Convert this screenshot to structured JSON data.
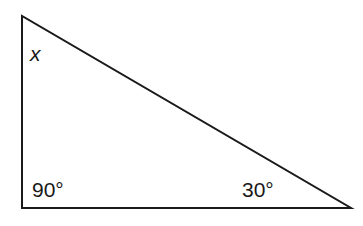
{
  "diagram": {
    "type": "right-triangle",
    "stroke_color": "#1a1a1a",
    "vertices": {
      "top": [
        22,
        16
      ],
      "right_angle": [
        22,
        208
      ],
      "acute": [
        351,
        208
      ]
    },
    "labels": {
      "top_angle": "x",
      "right_angle": "90°",
      "bottom_right_angle": "30°"
    }
  }
}
